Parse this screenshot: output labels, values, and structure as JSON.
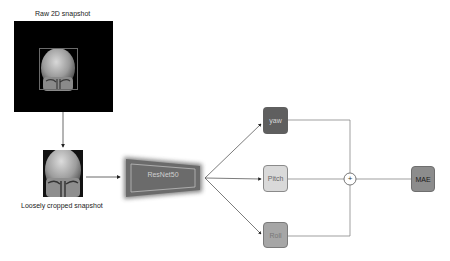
{
  "labels": {
    "raw_snapshot": "Raw 2D snapshot",
    "cropped_snapshot": "Loosely cropped snapshot",
    "backbone": "ResNet50",
    "yaw": "yaw",
    "pitch": "Pitch",
    "roll": "Roll",
    "combine_symbol": "+",
    "loss": "MAE"
  },
  "colors": {
    "yaw_fill": "#5f5f5f",
    "pitch_fill": "#d9d9d9",
    "roll_fill": "#a6a6a6",
    "mae_fill": "#8c8c8c",
    "backbone_fill": "#6b6b6b",
    "line": "#555555"
  },
  "nodes": [
    {
      "id": "raw",
      "label": "Raw 2D snapshot",
      "type": "image"
    },
    {
      "id": "crop",
      "label": "Loosely cropped snapshot",
      "type": "image"
    },
    {
      "id": "resnet",
      "label": "ResNet50",
      "type": "network"
    },
    {
      "id": "yaw",
      "label": "yaw",
      "type": "output"
    },
    {
      "id": "pitch",
      "label": "Pitch",
      "type": "output"
    },
    {
      "id": "roll",
      "label": "Roll",
      "type": "output"
    },
    {
      "id": "sum",
      "label": "+",
      "type": "operator"
    },
    {
      "id": "mae",
      "label": "MAE",
      "type": "loss"
    }
  ],
  "edges": [
    {
      "from": "raw",
      "to": "crop"
    },
    {
      "from": "crop",
      "to": "resnet"
    },
    {
      "from": "resnet",
      "to": "yaw"
    },
    {
      "from": "resnet",
      "to": "pitch"
    },
    {
      "from": "resnet",
      "to": "roll"
    },
    {
      "from": "yaw",
      "to": "sum"
    },
    {
      "from": "pitch",
      "to": "sum"
    },
    {
      "from": "roll",
      "to": "sum"
    },
    {
      "from": "sum",
      "to": "mae"
    }
  ]
}
